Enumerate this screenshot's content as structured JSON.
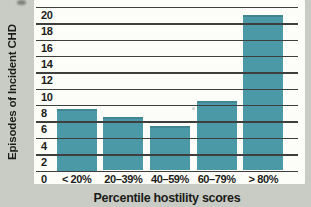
{
  "chart_data": {
    "type": "bar",
    "categories": [
      "< 20%",
      "20–39%",
      "40–59%",
      "60–79%",
      "> 80%"
    ],
    "values": [
      7.5,
      6.5,
      5.5,
      8.5,
      19
    ],
    "title": "",
    "xlabel": "Percentile hostility scores",
    "ylabel": "Episodes of Incident CHD",
    "ylim": [
      0,
      20
    ],
    "yticks": [
      0,
      2,
      4,
      6,
      8,
      10,
      12,
      14,
      16,
      18,
      20
    ],
    "grid": true,
    "legend": false,
    "gridlines_over_bars": true,
    "colors": {
      "bar": "#4b99a7",
      "gridline": "#3e3e3c",
      "text": "#1c1c1a",
      "page_background": "#c9ccc4",
      "plot_background": "#fcfcf9"
    }
  }
}
